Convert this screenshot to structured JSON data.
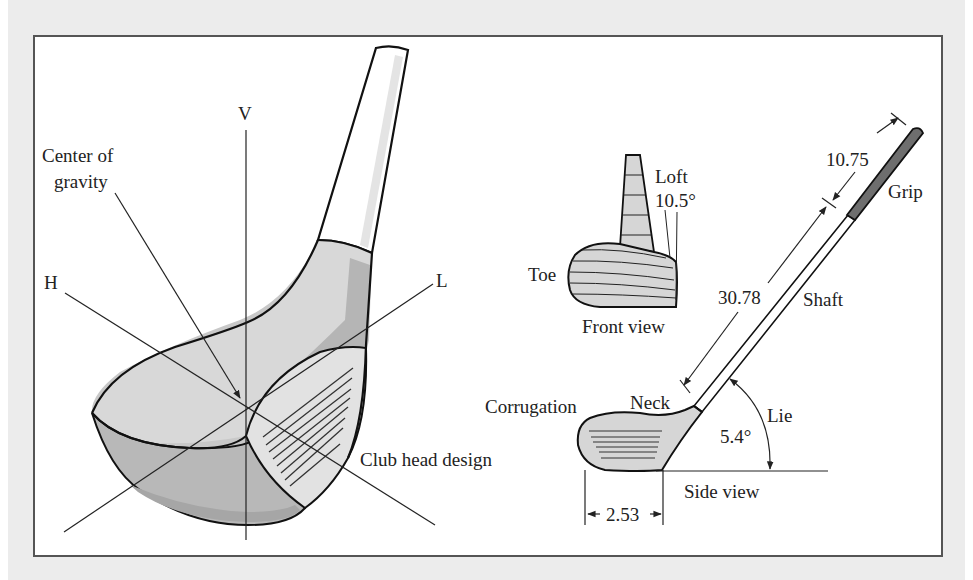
{
  "figure": {
    "perspective_view": {
      "axis_labels": {
        "vertical": "V",
        "horizontal": "H",
        "longitudinal": "L"
      },
      "center_of_gravity_line1": "Center of",
      "center_of_gravity_line2": "gravity",
      "club_head_design": "Club head design"
    },
    "front_view": {
      "toe": "Toe",
      "loft": "Loft",
      "loft_angle": "10.5°",
      "caption": "Front view"
    },
    "side_view": {
      "grip_length": "10.75",
      "grip": "Grip",
      "shaft_length": "30.78",
      "shaft": "Shaft",
      "neck": "Neck",
      "corrugation": "Corrugation",
      "lie": "Lie",
      "lie_angle": "5.4°",
      "caption": "Side view",
      "head_length": "2.53"
    },
    "colors": {
      "background": "#ececec",
      "frame_border": "#555555",
      "head_light": "#d9d9d9",
      "head_mid": "#bdbdbd",
      "head_dark": "#a8a8a8",
      "grip": "#6e6e6e",
      "outline": "#111111"
    }
  }
}
